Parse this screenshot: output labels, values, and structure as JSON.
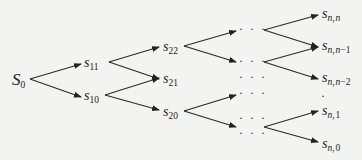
{
  "diagram": {
    "type": "recombining binomial tree",
    "nodes": {
      "root": {
        "base": "S",
        "sub": "0"
      },
      "s11": {
        "base": "s",
        "sub": "11"
      },
      "s10": {
        "base": "s",
        "sub": "10"
      },
      "s22": {
        "base": "s",
        "sub": "22"
      },
      "s21": {
        "base": "s",
        "sub": "21"
      },
      "s20": {
        "base": "s",
        "sub": "20"
      },
      "snn": {
        "base": "s",
        "sub_a": "n",
        "comma": ",",
        "sub_b": "n"
      },
      "snn1": {
        "base": "s",
        "sub_a": "n",
        "comma": ",",
        "sub_b": "n",
        "sub_c": "−1"
      },
      "snn2": {
        "base": "s",
        "sub_a": "n",
        "comma": ",",
        "sub_b": "n",
        "sub_c": "−2"
      },
      "sn1": {
        "base": "s",
        "sub_a": "n",
        "comma": ",",
        "sub_c": "1"
      },
      "sn0": {
        "base": "s",
        "sub_a": "n",
        "comma": ",",
        "sub_c": "0"
      }
    },
    "ellipsis": "· · ·",
    "vertical_dot": "·",
    "edges": [
      [
        "S0",
        "s11"
      ],
      [
        "S0",
        "s10"
      ],
      [
        "s11",
        "s22"
      ],
      [
        "s11",
        "s21"
      ],
      [
        "s10",
        "s21"
      ],
      [
        "s10",
        "s20"
      ],
      [
        "s22",
        "..."
      ],
      [
        "s20",
        "..."
      ],
      [
        "...",
        "snn"
      ],
      [
        "...",
        "snn1"
      ],
      [
        "...",
        "snn2"
      ],
      [
        "...",
        "sn1"
      ],
      [
        "...",
        "sn0"
      ]
    ]
  }
}
